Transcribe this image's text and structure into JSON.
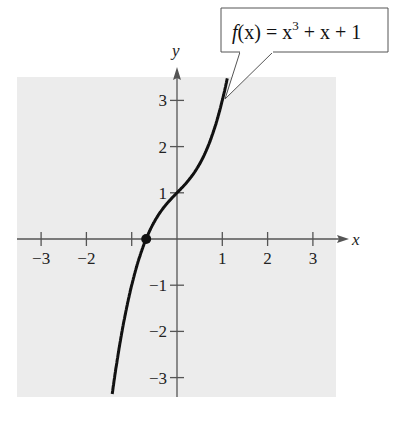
{
  "chart_data": {
    "type": "line",
    "title": "",
    "function": "f(x) = x^3 + x + 1",
    "xlabel": "x",
    "ylabel": "y",
    "xlim": [
      -3.5,
      3.5
    ],
    "ylim": [
      -3.5,
      3.5
    ],
    "x_ticks": [
      -3,
      -2,
      -1,
      1,
      2,
      3
    ],
    "y_ticks": [
      -3,
      -2,
      -1,
      1,
      2,
      3
    ],
    "x_tick_labels": [
      "−3",
      "−2",
      "",
      "1",
      "2",
      "3"
    ],
    "y_tick_labels": [
      "−3",
      "−2",
      "−1",
      "1",
      "2",
      "3"
    ],
    "grid": false,
    "series": [
      {
        "name": "f(x) = x^3 + x + 1",
        "x": [
          -1.25,
          -1.0,
          -0.75,
          -0.68,
          -0.5,
          -0.25,
          0,
          0.25,
          0.5,
          0.75,
          1.0,
          1.1
        ],
        "values": [
          -2.2,
          -1.0,
          -0.17,
          0.0,
          0.38,
          0.73,
          1.0,
          1.27,
          1.63,
          2.17,
          3.0,
          3.43
        ]
      }
    ],
    "annotations": [
      {
        "type": "callout",
        "text": "f(x) = x³ + x + 1",
        "points_to": [
          1.0,
          3.0
        ]
      },
      {
        "type": "marker",
        "label": "real zero",
        "x": -0.68,
        "y": 0
      }
    ],
    "colors": {
      "panel": "#ececec",
      "curve": "#111111",
      "axes": "#555555"
    }
  },
  "labels": {
    "x_axis": "x",
    "y_axis": "y",
    "callout_f": "f",
    "callout_x": "(x) = x",
    "callout_exp": "3",
    "callout_rest": " + x + 1"
  }
}
